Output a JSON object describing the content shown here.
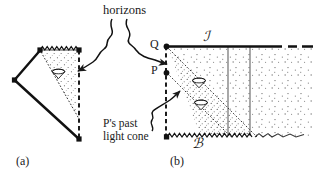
{
  "figure": {
    "title_caption": "horizons",
    "panels": [
      {
        "key": "a",
        "label": "(a)",
        "type": "conformal-diagram",
        "features": [
          "zigzag-singularity-top",
          "dashed-axis-right",
          "shaded-region",
          "light-cone",
          "horizon-line"
        ]
      },
      {
        "key": "b",
        "label": "(b)",
        "type": "conformal-diagram",
        "features": [
          "zigzag-singularity-bottom",
          "dashed-axis-left",
          "stippled-region",
          "two-light-cones",
          "scri-line",
          "vertical-worldlines"
        ]
      }
    ]
  },
  "labels": {
    "horizons": "horizons",
    "past_light_cone_line1": "P's past",
    "past_light_cone_line2": "light cone",
    "point_Q": "Q",
    "point_P": "P",
    "scri": "ℐ",
    "b_surface": "ℬ",
    "panel_a": "(a)",
    "panel_b": "(b)"
  },
  "colors": {
    "ink": "#1a1a1a",
    "line": "#111111",
    "gray_line": "#777777",
    "stipple": "#4a4a4a",
    "background": "#ffffff"
  },
  "geometry": {
    "panel_a": {
      "top_left_vertex": [
        40,
        50
      ],
      "top_right_vertex": [
        79,
        50
      ],
      "left_vertex": [
        14,
        80
      ],
      "bottom_vertex": [
        79,
        139
      ]
    },
    "panel_b": {
      "point_Q": [
        166,
        46
      ],
      "point_P": [
        166,
        73
      ],
      "origin_bottom": [
        166,
        137
      ],
      "scri_line_end": [
        282,
        46
      ],
      "dash_tail_end": [
        313,
        46
      ],
      "worldline_1_x": [
        228
      ],
      "worldline_2_x": [
        250
      ]
    }
  }
}
